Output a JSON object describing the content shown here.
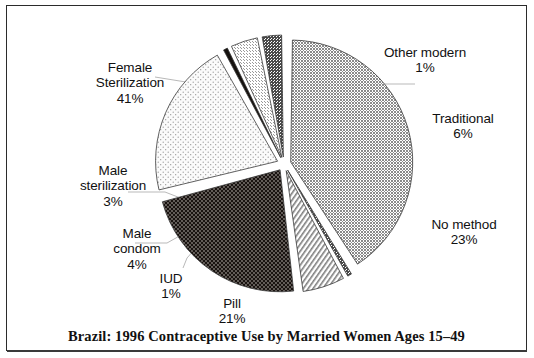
{
  "caption": "Brazil: 1996 Contraceptive Use by Married Women Ages 15–49",
  "labels": {
    "female_sterilization": {
      "name": "Female\nSterilization",
      "pct": "41%"
    },
    "other_modern": {
      "name": "Other modern",
      "pct": "1%"
    },
    "traditional": {
      "name": "Traditional",
      "pct": "6%"
    },
    "no_method": {
      "name": "No method",
      "pct": "23%"
    },
    "pill": {
      "name": "Pill",
      "pct": "21%"
    },
    "iud": {
      "name": "IUD",
      "pct": "1%"
    },
    "male_condom": {
      "name": "Male\ncondom",
      "pct": "4%"
    },
    "male_sterilization": {
      "name": "Male\nsterilization",
      "pct": "3%"
    }
  },
  "chart_data": {
    "type": "pie",
    "title": "Brazil: 1996 Contraceptive Use by Married Women Ages 15–49",
    "unit": "percent",
    "total": 100,
    "legend": "none",
    "labels_position": "outside-with-leader-lines",
    "start_angle_deg": -90,
    "direction": "clockwise",
    "categories": [
      "Female Sterilization",
      "Other modern",
      "Traditional",
      "No method",
      "Pill",
      "IUD",
      "Male condom",
      "Male sterilization"
    ],
    "values": [
      41,
      1,
      6,
      23,
      21,
      1,
      4,
      3
    ],
    "slices": [
      {
        "label": "Female Sterilization",
        "value": 41,
        "display": "41%",
        "fill": "gray-checker",
        "color": "#8f8f8f",
        "exploded": true
      },
      {
        "label": "Other modern",
        "value": 1,
        "display": "1%",
        "fill": "dark-checker",
        "color": "#666666",
        "exploded": true
      },
      {
        "label": "Traditional",
        "value": 6,
        "display": "6%",
        "fill": "diagonal-hatch",
        "color": "#b5b5b5",
        "exploded": true
      },
      {
        "label": "No method",
        "value": 23,
        "display": "23%",
        "fill": "black-dots",
        "color": "#1a140f",
        "exploded": true
      },
      {
        "label": "Pill",
        "value": 21,
        "display": "21%",
        "fill": "light-dots",
        "color": "#f2f2f2",
        "exploded": true
      },
      {
        "label": "IUD",
        "value": 1,
        "display": "1%",
        "fill": "solid-black",
        "color": "#111111",
        "exploded": true
      },
      {
        "label": "Male condom",
        "value": 4,
        "display": "4%",
        "fill": "light-checker",
        "color": "#dcdcdc",
        "exploded": true
      },
      {
        "label": "Male sterilization",
        "value": 3,
        "display": "3%",
        "fill": "dark-checker",
        "color": "#575757",
        "exploded": true
      }
    ]
  }
}
